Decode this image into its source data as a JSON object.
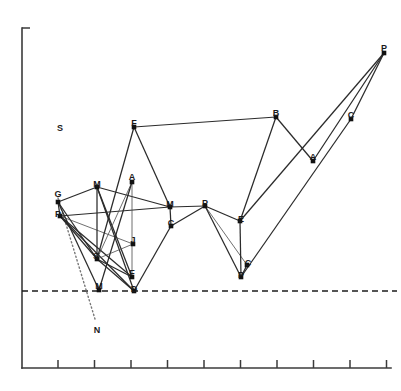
{
  "chart_data": {
    "type": "scatter",
    "title": "",
    "subtitle": "",
    "xlabel": "",
    "ylabel": "",
    "grid": false,
    "legend": "none",
    "axis": {
      "x_axis_y": 368,
      "y_axis_x": 22,
      "y_axis_top": 28,
      "x_axis_right": 391,
      "x_ticks": [
        58,
        94.5,
        131,
        167.5,
        204,
        240.5,
        277,
        313.5,
        350,
        386.5
      ],
      "x_tick_labels": [
        "",
        "",
        "",
        "",
        "",
        "",
        "",
        "",
        "",
        ""
      ],
      "y_tick_top_mark": true
    },
    "reference_lines": [
      {
        "name": "dashed-baseline",
        "style": "dashed",
        "x1": 22,
        "y1": 291,
        "x2": 397,
        "y2": 291
      },
      {
        "name": "dotted-projection",
        "style": "dotted",
        "x1": 58,
        "y1": 198,
        "x2": 95,
        "y2": 319
      }
    ],
    "points": [
      {
        "id": "p1",
        "label": "G",
        "x": 58,
        "y": 202,
        "lx": 58,
        "ly": 197
      },
      {
        "id": "p2",
        "label": "P",
        "x": 60,
        "y": 216,
        "lx": 58,
        "ly": 217
      },
      {
        "id": "p3",
        "label": "M",
        "x": 97,
        "y": 187,
        "lx": 97,
        "ly": 187
      },
      {
        "id": "p4",
        "label": "A",
        "x": 132,
        "y": 182,
        "lx": 132,
        "ly": 180
      },
      {
        "id": "p5",
        "label": "F",
        "x": 134,
        "y": 127,
        "lx": 134,
        "ly": 126
      },
      {
        "id": "p6",
        "label": "S",
        "x": 97,
        "y": 259,
        "lx": 96,
        "ly": 259
      },
      {
        "id": "p7",
        "label": "J",
        "x": 133,
        "y": 244,
        "lx": 133,
        "ly": 243
      },
      {
        "id": "p8",
        "label": "M",
        "x": 99,
        "y": 290,
        "lx": 99,
        "ly": 289
      },
      {
        "id": "p9",
        "label": "F",
        "x": 132,
        "y": 277,
        "lx": 132,
        "ly": 276
      },
      {
        "id": "p10",
        "label": "D",
        "x": 134,
        "y": 291,
        "lx": 134,
        "ly": 292
      },
      {
        "id": "p11",
        "label": "M",
        "x": 170,
        "y": 207,
        "lx": 170,
        "ly": 207
      },
      {
        "id": "p12",
        "label": "C",
        "x": 171,
        "y": 226,
        "lx": 171,
        "ly": 226
      },
      {
        "id": "p13",
        "label": "P",
        "x": 205,
        "y": 206,
        "lx": 205,
        "ly": 206
      },
      {
        "id": "p14",
        "label": "E",
        "x": 240,
        "y": 221,
        "lx": 241,
        "ly": 222
      },
      {
        "id": "p15",
        "label": "C",
        "x": 247,
        "y": 265,
        "lx": 248,
        "ly": 266
      },
      {
        "id": "p16",
        "label": "P",
        "x": 241,
        "y": 277,
        "lx": 241,
        "ly": 278
      },
      {
        "id": "p17",
        "label": "B",
        "x": 276,
        "y": 117,
        "lx": 276,
        "ly": 116
      },
      {
        "id": "p18",
        "label": "A",
        "x": 313,
        "y": 161,
        "lx": 313,
        "ly": 160
      },
      {
        "id": "p19",
        "label": "C",
        "x": 351,
        "y": 119,
        "lx": 351,
        "ly": 118
      },
      {
        "id": "p20",
        "label": "P",
        "x": 384,
        "y": 53,
        "lx": 384,
        "ly": 51
      }
    ],
    "edges": [
      {
        "from": "p1",
        "to": "p3",
        "weight": "normal"
      },
      {
        "from": "p1",
        "to": "p2",
        "weight": "normal"
      },
      {
        "from": "p1",
        "to": "p6",
        "weight": "normal"
      },
      {
        "from": "p1",
        "to": "p8",
        "weight": "normal"
      },
      {
        "from": "p2",
        "to": "p6",
        "weight": "normal"
      },
      {
        "from": "p2",
        "to": "p7",
        "weight": "thin"
      },
      {
        "from": "p2",
        "to": "p9",
        "weight": "normal"
      },
      {
        "from": "p2",
        "to": "p10",
        "weight": "normal"
      },
      {
        "from": "p2",
        "to": "p11",
        "weight": "normal"
      },
      {
        "from": "p3",
        "to": "p6",
        "weight": "normal"
      },
      {
        "from": "p3",
        "to": "p9",
        "weight": "normal"
      },
      {
        "from": "p3",
        "to": "p10",
        "weight": "normal"
      },
      {
        "from": "p3",
        "to": "p11",
        "weight": "normal"
      },
      {
        "from": "p4",
        "to": "p6",
        "weight": "thin"
      },
      {
        "from": "p4",
        "to": "p8",
        "weight": "normal"
      },
      {
        "from": "p4",
        "to": "p9",
        "weight": "thin"
      },
      {
        "from": "p5",
        "to": "p6",
        "weight": "normal"
      },
      {
        "from": "p5",
        "to": "p11",
        "weight": "normal"
      },
      {
        "from": "p5",
        "to": "p17",
        "weight": "normal"
      },
      {
        "from": "p6",
        "to": "p7",
        "weight": "thin"
      },
      {
        "from": "p6",
        "to": "p9",
        "weight": "normal"
      },
      {
        "from": "p6",
        "to": "p10",
        "weight": "normal"
      },
      {
        "from": "p10",
        "to": "p12",
        "weight": "normal"
      },
      {
        "from": "p11",
        "to": "p12",
        "weight": "normal"
      },
      {
        "from": "p11",
        "to": "p13",
        "weight": "normal"
      },
      {
        "from": "p12",
        "to": "p13",
        "weight": "normal"
      },
      {
        "from": "p13",
        "to": "p14",
        "weight": "normal"
      },
      {
        "from": "p13",
        "to": "p15",
        "weight": "thin"
      },
      {
        "from": "p13",
        "to": "p16",
        "weight": "normal"
      },
      {
        "from": "p14",
        "to": "p16",
        "weight": "normal"
      },
      {
        "from": "p14",
        "to": "p17",
        "weight": "normal"
      },
      {
        "from": "p14",
        "to": "p20",
        "weight": "normal"
      },
      {
        "from": "p15",
        "to": "p16",
        "weight": "normal"
      },
      {
        "from": "p17",
        "to": "p18",
        "weight": "normal"
      },
      {
        "from": "p18",
        "to": "p20",
        "weight": "normal"
      },
      {
        "from": "p19",
        "to": "p20",
        "weight": "normal"
      },
      {
        "from": "p16",
        "to": "p19",
        "weight": "normal"
      }
    ],
    "annotations": [
      {
        "id": "a1",
        "text": "S",
        "x": 60,
        "y": 131
      },
      {
        "id": "a2",
        "text": "N",
        "x": 97,
        "y": 333
      }
    ]
  }
}
